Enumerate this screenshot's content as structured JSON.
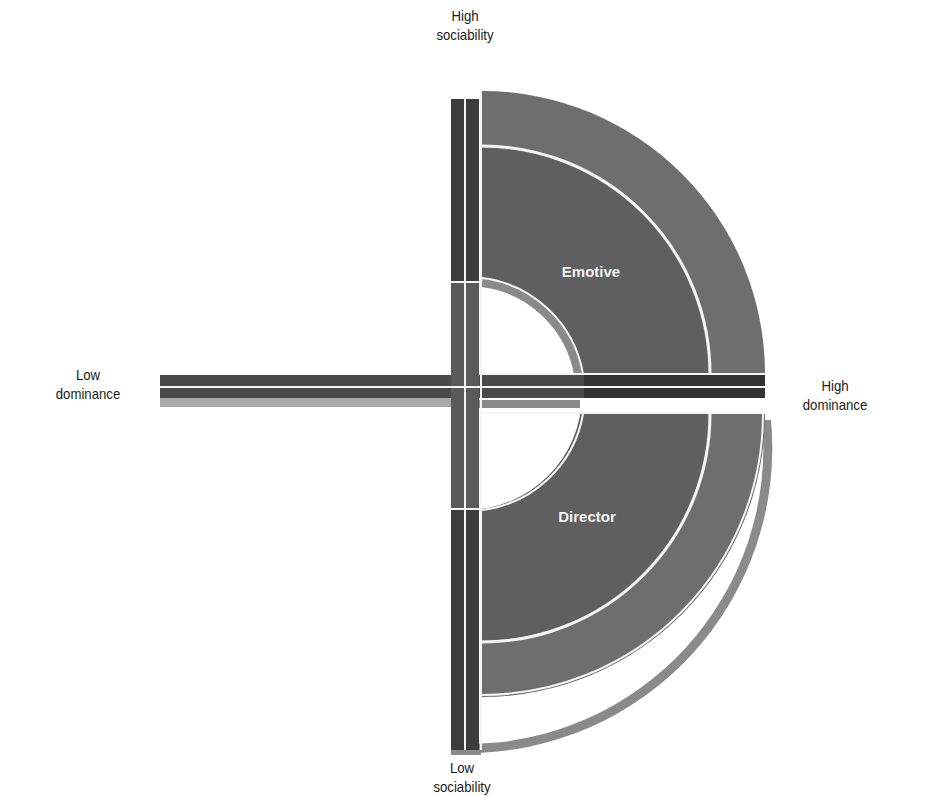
{
  "axes": {
    "top": {
      "line1": "High",
      "line2": "sociability"
    },
    "bottom": {
      "line1": "Low",
      "line2": "sociability"
    },
    "left": {
      "line1": "Low",
      "line2": "dominance"
    },
    "right": {
      "line1": "High",
      "line2": "dominance"
    }
  },
  "quadrants": {
    "upper_right": {
      "label": "Emotive"
    },
    "lower_right": {
      "label": "Director"
    }
  },
  "colors": {
    "outer_band": "#6e6e6e",
    "inner_band": "#5f5f5f",
    "axis_bar": "#3c3c3c",
    "axis_bar_light": "#8a8a8a",
    "shadow_band": "#a9a9a9",
    "separator": "#f4f4f4"
  }
}
